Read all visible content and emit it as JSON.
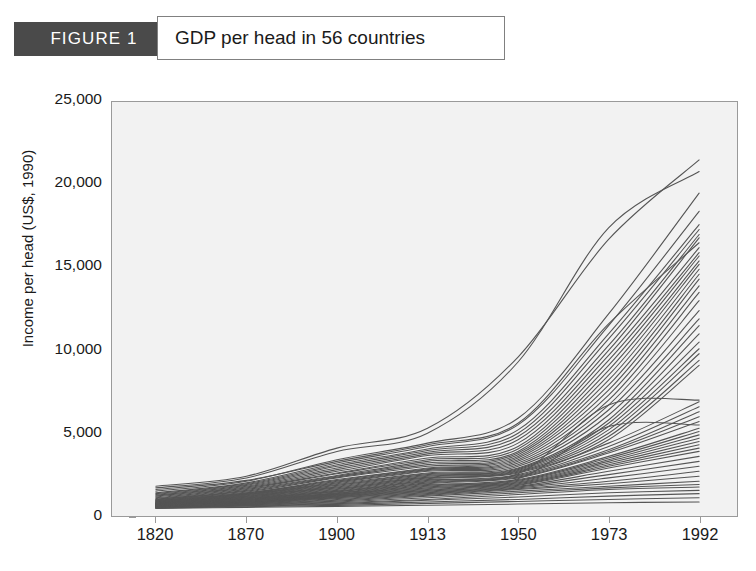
{
  "figure": {
    "badge_label": "FIGURE 1",
    "title": "GDP per head in 56 countries"
  },
  "colors": {
    "badge_background": "#4a4a4a",
    "badge_text": "#ffffff",
    "title_border": "#808080",
    "plot_background": "#f2f2f2",
    "plot_border": "#9a9a9a",
    "line_color": "#555555",
    "text": "#1a1a1a"
  },
  "axes": {
    "y_title": "Income per head (US$, 1990)",
    "y_ticks": [
      "25,000",
      "20,000",
      "15,000",
      "10,000",
      "5,000",
      "0"
    ],
    "x_ticks": [
      "1820",
      "1870",
      "1900",
      "1913",
      "1950",
      "1973",
      "1992"
    ]
  },
  "chart_data": {
    "type": "line",
    "title": "GDP per head in 56 countries",
    "xlabel": "",
    "ylabel": "Income per head (US$, 1990)",
    "x": [
      "1820",
      "1870",
      "1900",
      "1913",
      "1950",
      "1973",
      "1992"
    ],
    "ylim": [
      0,
      25000
    ],
    "yticks": [
      0,
      5000,
      10000,
      15000,
      20000,
      25000
    ],
    "grid": false,
    "legend": "none",
    "note": "56 country income-per-head trajectories; x axis is categorical with unequal year spacing",
    "series": [
      {
        "name": "Country 1",
        "values": [
          1800,
          2400,
          4100,
          5300,
          9600,
          16700,
          21500
        ]
      },
      {
        "name": "Country 2",
        "values": [
          1700,
          2300,
          3900,
          5000,
          9300,
          17400,
          20800
        ]
      },
      {
        "name": "Country 3",
        "values": [
          1500,
          2100,
          3400,
          4400,
          5900,
          12200,
          19500
        ]
      },
      {
        "name": "Country 4",
        "values": [
          1400,
          2000,
          3200,
          4200,
          5500,
          11500,
          18400
        ]
      },
      {
        "name": "Country 5",
        "values": [
          1350,
          1950,
          3100,
          4050,
          5200,
          11000,
          17600
        ]
      },
      {
        "name": "Country 6",
        "values": [
          1300,
          1900,
          3000,
          3950,
          5000,
          10700,
          17300
        ]
      },
      {
        "name": "Country 7",
        "values": [
          1250,
          1850,
          2900,
          3850,
          4800,
          10300,
          17000
        ]
      },
      {
        "name": "Country 8",
        "values": [
          1200,
          1800,
          2800,
          3750,
          4600,
          10000,
          16800
        ]
      },
      {
        "name": "Country 9",
        "values": [
          1600,
          2150,
          3300,
          4300,
          5600,
          11600,
          16500
        ]
      },
      {
        "name": "Country 10",
        "values": [
          1150,
          1750,
          2700,
          3650,
          4400,
          9700,
          16200
        ]
      },
      {
        "name": "Country 11",
        "values": [
          1100,
          1700,
          2600,
          3500,
          4200,
          9400,
          15900
        ]
      },
      {
        "name": "Country 12",
        "values": [
          1050,
          1650,
          2550,
          3400,
          4050,
          9100,
          15700
        ]
      },
      {
        "name": "Country 13",
        "values": [
          1000,
          1600,
          2450,
          3300,
          3900,
          8800,
          15400
        ]
      },
      {
        "name": "Country 14",
        "values": [
          980,
          1550,
          2400,
          3200,
          3800,
          8500,
          15200
        ]
      },
      {
        "name": "Country 15",
        "values": [
          960,
          1500,
          2350,
          3100,
          3700,
          8200,
          14900
        ]
      },
      {
        "name": "Country 16",
        "values": [
          940,
          1450,
          2300,
          3000,
          3600,
          7900,
          14600
        ]
      },
      {
        "name": "Country 17",
        "values": [
          920,
          1400,
          2200,
          2900,
          3500,
          7600,
          14300
        ]
      },
      {
        "name": "Country 18",
        "values": [
          900,
          1380,
          2150,
          2850,
          3400,
          7300,
          13900
        ]
      },
      {
        "name": "Country 19",
        "values": [
          880,
          1350,
          2100,
          2800,
          3300,
          7000,
          13500
        ]
      },
      {
        "name": "Country 20",
        "values": [
          860,
          1320,
          2050,
          2750,
          3200,
          6700,
          13000
        ]
      },
      {
        "name": "Country 21",
        "values": [
          840,
          1300,
          2000,
          2700,
          3100,
          6400,
          12400
        ]
      },
      {
        "name": "Country 22",
        "values": [
          820,
          1280,
          1950,
          2600,
          3000,
          6100,
          11900
        ]
      },
      {
        "name": "Country 23",
        "values": [
          800,
          1250,
          1900,
          2550,
          2900,
          5800,
          11500
        ]
      },
      {
        "name": "Country 24",
        "values": [
          790,
          1220,
          1850,
          2500,
          2850,
          5600,
          11000
        ]
      },
      {
        "name": "Country 25",
        "values": [
          780,
          1200,
          1800,
          2450,
          2800,
          5400,
          10500
        ]
      },
      {
        "name": "Country 26",
        "values": [
          770,
          1180,
          1750,
          2400,
          2750,
          5200,
          10100
        ]
      },
      {
        "name": "Country 27",
        "values": [
          760,
          1150,
          1700,
          2350,
          2700,
          5000,
          9800
        ]
      },
      {
        "name": "Country 28",
        "values": [
          750,
          1130,
          1650,
          2300,
          2650,
          4800,
          9400
        ]
      },
      {
        "name": "Country 29",
        "values": [
          740,
          1100,
          1600,
          2250,
          2600,
          4600,
          9100
        ]
      },
      {
        "name": "Country 30",
        "values": [
          730,
          1080,
          1550,
          2200,
          2550,
          6700,
          7000
        ]
      },
      {
        "name": "Country 31",
        "values": [
          720,
          1050,
          1500,
          2150,
          2500,
          4400,
          6900
        ]
      },
      {
        "name": "Country 32",
        "values": [
          710,
          1030,
          1480,
          2100,
          2450,
          4200,
          6600
        ]
      },
      {
        "name": "Country 33",
        "values": [
          700,
          1000,
          1450,
          2050,
          2400,
          4000,
          6300
        ]
      },
      {
        "name": "Country 34",
        "values": [
          690,
          980,
          1400,
          2000,
          2350,
          3900,
          6000
        ]
      },
      {
        "name": "Country 35",
        "values": [
          680,
          960,
          1380,
          1950,
          2300,
          3800,
          5700
        ]
      },
      {
        "name": "Country 36",
        "values": [
          670,
          940,
          1350,
          1900,
          2250,
          5400,
          5500
        ]
      },
      {
        "name": "Country 37",
        "values": [
          660,
          920,
          1320,
          1850,
          2200,
          3600,
          5300
        ]
      },
      {
        "name": "Country 38",
        "values": [
          650,
          900,
          1300,
          1800,
          2150,
          3500,
          5100
        ]
      },
      {
        "name": "Country 39",
        "values": [
          640,
          880,
          1280,
          1750,
          2100,
          3400,
          4900
        ]
      },
      {
        "name": "Country 40",
        "values": [
          630,
          860,
          1250,
          1700,
          2050,
          3300,
          4700
        ]
      },
      {
        "name": "Country 41",
        "values": [
          620,
          840,
          1220,
          1650,
          2000,
          3200,
          4500
        ]
      },
      {
        "name": "Country 42",
        "values": [
          610,
          820,
          1200,
          1600,
          1950,
          3100,
          4300
        ]
      },
      {
        "name": "Country 43",
        "values": [
          600,
          800,
          1180,
          1550,
          1900,
          3000,
          4100
        ]
      },
      {
        "name": "Country 44",
        "values": [
          590,
          790,
          1150,
          1500,
          1850,
          2900,
          3900
        ]
      },
      {
        "name": "Country 45",
        "values": [
          580,
          780,
          1120,
          1450,
          1800,
          2700,
          3600
        ]
      },
      {
        "name": "Country 46",
        "values": [
          570,
          760,
          1100,
          1400,
          1750,
          2500,
          3300
        ]
      },
      {
        "name": "Country 47",
        "values": [
          560,
          740,
          1050,
          1350,
          1700,
          2300,
          3000
        ]
      },
      {
        "name": "Country 48",
        "values": [
          550,
          720,
          1000,
          1300,
          1650,
          2100,
          2700
        ]
      },
      {
        "name": "Country 49",
        "values": [
          540,
          700,
          950,
          1250,
          1600,
          1950,
          2400
        ]
      },
      {
        "name": "Country 50",
        "values": [
          530,
          680,
          900,
          1200,
          1500,
          1800,
          2100
        ]
      },
      {
        "name": "Country 51",
        "values": [
          520,
          660,
          850,
          1100,
          1400,
          1700,
          1900
        ]
      },
      {
        "name": "Country 52",
        "values": [
          510,
          640,
          800,
          1000,
          1300,
          1600,
          1750
        ]
      },
      {
        "name": "Country 53",
        "values": [
          500,
          620,
          750,
          950,
          1150,
          1400,
          1550
        ]
      },
      {
        "name": "Country 54",
        "values": [
          490,
          600,
          700,
          850,
          1000,
          1200,
          1350
        ]
      },
      {
        "name": "Country 55",
        "values": [
          480,
          560,
          640,
          760,
          880,
          1000,
          1100
        ]
      },
      {
        "name": "Country 56",
        "values": [
          460,
          520,
          580,
          650,
          720,
          800,
          850
        ]
      }
    ]
  }
}
